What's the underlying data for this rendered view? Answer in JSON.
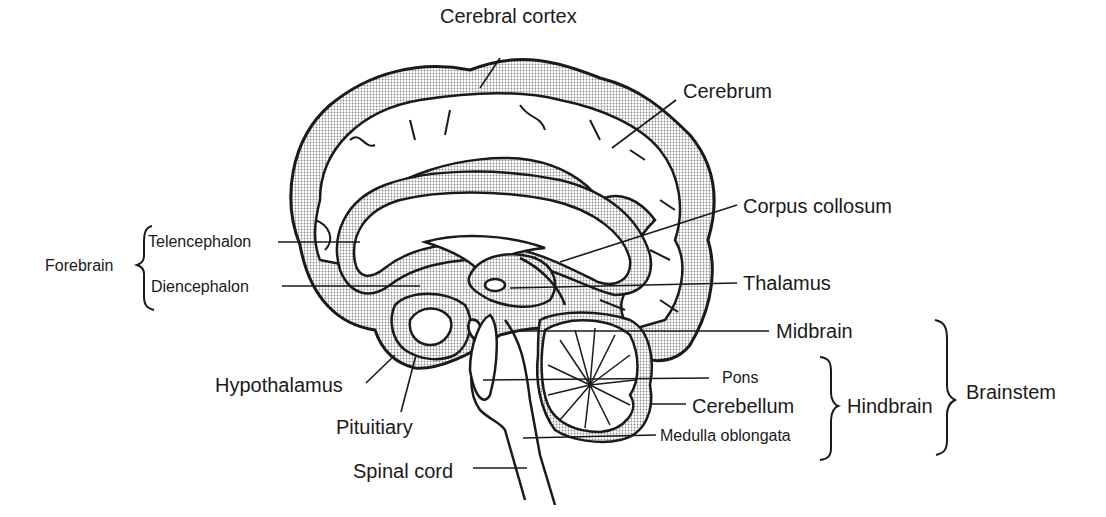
{
  "diagram": {
    "type": "anatomical-illustration",
    "colors": {
      "stroke": "#1a1a1a",
      "shade": "#bdbdbd",
      "background": "#ffffff"
    },
    "labels": {
      "cerebral_cortex": "Cerebral cortex",
      "cerebrum": "Cerebrum",
      "corpus_collosum": "Corpus collosum",
      "thalamus": "Thalamus",
      "midbrain": "Midbrain",
      "pons": "Pons",
      "cerebellum": "Cerebellum",
      "medulla_oblongata": "Medulla oblongata",
      "hypothalamus": "Hypothalamus",
      "pituitiary": "Pituitiary",
      "spinal_cord": "Spinal cord",
      "telencephalon": "Telencephalon",
      "diencephalon": "Diencephalon"
    },
    "groups": {
      "forebrain": {
        "label": "Forebrain",
        "members": [
          "Telencephalon",
          "Diencephalon"
        ]
      },
      "hindbrain": {
        "label": "Hindbrain",
        "members": [
          "Pons",
          "Cerebellum",
          "Medulla oblongata"
        ]
      },
      "brainstem": {
        "label": "Brainstem",
        "members": [
          "Midbrain",
          "Pons",
          "Cerebellum",
          "Medulla oblongata"
        ]
      }
    }
  }
}
